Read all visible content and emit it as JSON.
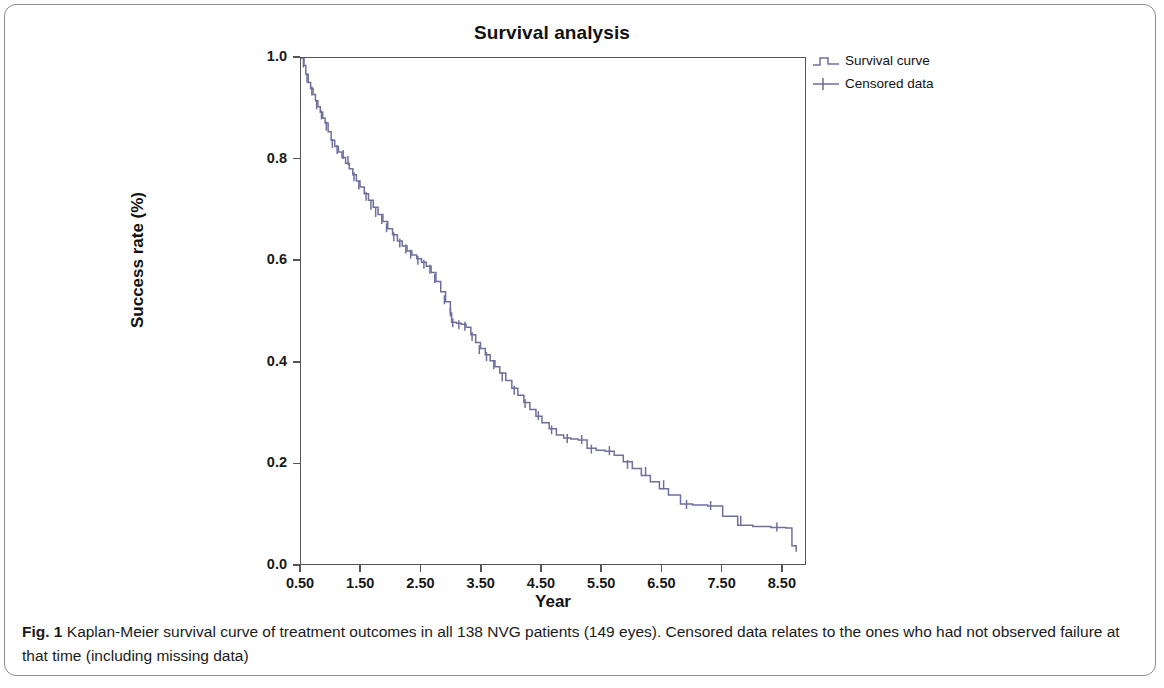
{
  "figure": {
    "caption_prefix": "Fig. 1",
    "caption_text": " Kaplan-Meier survival curve of treatment outcomes in all 138 NVG patients (149 eyes). Censored data relates to the ones who had not observed failure at that time (including missing data)"
  },
  "chart_data": {
    "type": "line",
    "subtype": "kaplan-meier-step",
    "title": "Survival analysis",
    "xlabel": "Year",
    "ylabel": "Success rate (%)",
    "xlim": [
      0.5,
      8.9
    ],
    "ylim": [
      0.0,
      1.0
    ],
    "grid": false,
    "legend_position": "right",
    "series": [
      {
        "name": "Survival curve",
        "color": "#6f6f9e",
        "style": "step",
        "x": [
          0.5,
          0.55,
          0.58,
          0.62,
          0.66,
          0.7,
          0.74,
          0.78,
          0.82,
          0.86,
          0.9,
          0.95,
          1.0,
          1.06,
          1.12,
          1.18,
          1.24,
          1.3,
          1.36,
          1.42,
          1.48,
          1.55,
          1.62,
          1.7,
          1.78,
          1.86,
          1.94,
          2.02,
          2.1,
          2.18,
          2.26,
          2.34,
          2.42,
          2.5,
          2.58,
          2.66,
          2.74,
          2.82,
          2.9,
          2.98,
          3.0,
          3.08,
          3.16,
          3.24,
          3.32,
          3.4,
          3.48,
          3.56,
          3.64,
          3.72,
          3.8,
          3.9,
          4.0,
          4.1,
          4.2,
          4.3,
          4.4,
          4.5,
          4.62,
          4.74,
          4.86,
          4.98,
          5.1,
          5.25,
          5.4,
          5.55,
          5.7,
          5.85,
          6.0,
          6.15,
          6.3,
          6.45,
          6.6,
          6.8,
          7.0,
          7.25,
          7.5,
          7.75,
          8.0,
          8.3,
          8.55,
          8.65,
          8.72
        ],
        "y": [
          1.0,
          0.985,
          0.968,
          0.952,
          0.94,
          0.928,
          0.916,
          0.904,
          0.893,
          0.882,
          0.872,
          0.855,
          0.838,
          0.826,
          0.815,
          0.804,
          0.793,
          0.782,
          0.77,
          0.758,
          0.746,
          0.733,
          0.72,
          0.706,
          0.692,
          0.678,
          0.664,
          0.652,
          0.64,
          0.63,
          0.62,
          0.612,
          0.605,
          0.598,
          0.59,
          0.578,
          0.56,
          0.54,
          0.52,
          0.498,
          0.48,
          0.478,
          0.476,
          0.47,
          0.455,
          0.44,
          0.428,
          0.416,
          0.404,
          0.392,
          0.38,
          0.365,
          0.35,
          0.336,
          0.322,
          0.308,
          0.295,
          0.282,
          0.27,
          0.258,
          0.252,
          0.25,
          0.248,
          0.232,
          0.228,
          0.226,
          0.218,
          0.205,
          0.192,
          0.178,
          0.166,
          0.152,
          0.14,
          0.122,
          0.12,
          0.118,
          0.098,
          0.08,
          0.078,
          0.076,
          0.075,
          0.04,
          0.028
        ]
      },
      {
        "name": "Censored data",
        "color": "#6f6f9e",
        "style": "cross-marker",
        "x": [
          0.54,
          0.6,
          0.68,
          0.76,
          0.84,
          0.92,
          1.02,
          1.1,
          1.2,
          1.28,
          1.38,
          1.46,
          1.58,
          1.66,
          1.74,
          1.84,
          1.92,
          2.04,
          2.14,
          2.24,
          2.32,
          2.44,
          2.54,
          2.64,
          2.72,
          2.88,
          2.98,
          3.02,
          3.12,
          3.22,
          3.34,
          3.46,
          3.58,
          3.7,
          3.84,
          4.04,
          4.22,
          4.44,
          4.66,
          4.92,
          5.16,
          5.32,
          5.62,
          5.92,
          6.22,
          6.52,
          6.9,
          7.3,
          7.8,
          8.4
        ],
        "y": [
          0.99,
          0.96,
          0.935,
          0.908,
          0.888,
          0.866,
          0.832,
          0.82,
          0.81,
          0.798,
          0.766,
          0.75,
          0.728,
          0.71,
          0.696,
          0.682,
          0.666,
          0.648,
          0.636,
          0.624,
          0.614,
          0.602,
          0.594,
          0.584,
          0.566,
          0.524,
          0.5,
          0.479,
          0.475,
          0.472,
          0.452,
          0.426,
          0.412,
          0.396,
          0.372,
          0.346,
          0.32,
          0.296,
          0.268,
          0.251,
          0.249,
          0.23,
          0.227,
          0.2,
          0.186,
          0.16,
          0.121,
          0.119,
          0.09,
          0.077
        ]
      }
    ],
    "x_ticks": [
      "0.50",
      "1.50",
      "2.50",
      "3.50",
      "4.50",
      "5.50",
      "6.50",
      "7.50",
      "8.50"
    ],
    "x_tick_values": [
      0.5,
      1.5,
      2.5,
      3.5,
      4.5,
      5.5,
      6.5,
      7.5,
      8.5
    ],
    "y_ticks": [
      "0.0",
      "0.2",
      "0.4",
      "0.6",
      "0.8",
      "1.0"
    ],
    "y_tick_values": [
      0.0,
      0.2,
      0.4,
      0.6,
      0.8,
      1.0
    ],
    "legend": [
      {
        "label": "Survival curve",
        "symbol": "step-line"
      },
      {
        "label": "Censored data",
        "symbol": "plus-marker"
      }
    ]
  }
}
